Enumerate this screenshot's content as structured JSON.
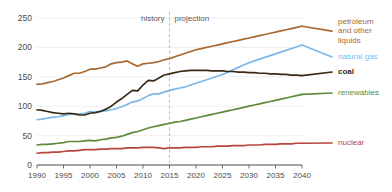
{
  "chart_data": {
    "type": "line",
    "title": "",
    "subtitle": "",
    "xlabel": "",
    "ylabel": "",
    "xlim": [
      1990,
      2040
    ],
    "ylim": [
      0,
      250
    ],
    "grid": true,
    "legend_position": "right-inline",
    "yticks": [
      0,
      50,
      100,
      150,
      200,
      250
    ],
    "ytick_labels": [
      "0",
      "50",
      "100",
      "150",
      "200",
      "250"
    ],
    "xticks": [
      1990,
      1995,
      2000,
      2005,
      2010,
      2015,
      2020,
      2025,
      2030,
      2035,
      2040
    ],
    "xtick_labels": [
      "1990",
      "1995",
      "2000",
      "2005",
      "2010",
      "2015",
      "2020",
      "2025",
      "2030",
      "2035",
      "2040"
    ],
    "annotations": [
      {
        "text": "history",
        "x": 2006,
        "y": 245
      },
      {
        "text": "projection",
        "x": 2023,
        "y": 245
      }
    ],
    "divider_x": 2015,
    "x": [
      1990,
      1991,
      1992,
      1993,
      1994,
      1995,
      1996,
      1997,
      1998,
      1999,
      2000,
      2001,
      2002,
      2003,
      2004,
      2005,
      2006,
      2007,
      2008,
      2009,
      2010,
      2011,
      2012,
      2013,
      2014,
      2015,
      2016,
      2017,
      2018,
      2019,
      2020,
      2021,
      2022,
      2023,
      2024,
      2025,
      2026,
      2027,
      2028,
      2029,
      2030,
      2031,
      2032,
      2033,
      2034,
      2035,
      2036,
      2037,
      2038,
      2039,
      2040
    ],
    "series": [
      {
        "name": "petroleum and other liquids",
        "color": "#a9682f",
        "label": "petroleum\nand other\nliquids",
        "label_lines": [
          "petroleum",
          "and other",
          "liquids"
        ],
        "values": [
          137,
          138,
          140,
          142,
          145,
          148,
          152,
          156,
          156,
          159,
          163,
          163,
          165,
          167,
          172,
          174,
          175,
          177,
          172,
          168,
          172,
          173,
          174,
          176,
          179,
          181,
          184,
          187,
          190,
          193,
          196,
          198,
          200,
          202,
          204,
          206,
          208,
          210,
          212,
          214,
          216,
          218,
          220,
          222,
          224,
          226,
          228,
          230,
          232,
          234,
          236
        ]
      },
      {
        "name": "natural gas",
        "color": "#7cb8e8",
        "label": "natural gas",
        "label_lines": [
          "natural gas"
        ],
        "values": [
          77,
          78,
          80,
          81,
          82,
          84,
          86,
          87,
          87,
          88,
          91,
          90,
          92,
          92,
          94,
          96,
          99,
          103,
          107,
          109,
          113,
          118,
          121,
          121,
          124,
          127,
          129,
          131,
          133,
          136,
          139,
          142,
          145,
          148,
          151,
          154,
          158,
          162,
          166,
          170,
          174,
          177,
          180,
          183,
          186,
          189,
          192,
          195,
          198,
          201,
          204
        ]
      },
      {
        "name": "coal",
        "color": "#3a2a14",
        "label": "coal",
        "label_lines": [
          "coal"
        ],
        "values": [
          94,
          93,
          91,
          89,
          88,
          87,
          88,
          87,
          85,
          85,
          88,
          89,
          91,
          95,
          100,
          107,
          113,
          120,
          127,
          126,
          136,
          144,
          143,
          148,
          153,
          155,
          157,
          159,
          160,
          161,
          161,
          161,
          161,
          160,
          160,
          160,
          159,
          159,
          158,
          158,
          157,
          157,
          156,
          156,
          155,
          155,
          154,
          154,
          153,
          153,
          152
        ]
      },
      {
        "name": "renewables",
        "color": "#5c8a3a",
        "label": "renewables",
        "label_lines": [
          "renewables"
        ],
        "values": [
          34,
          35,
          35,
          36,
          37,
          38,
          40,
          40,
          40,
          41,
          42,
          41,
          43,
          44,
          46,
          47,
          49,
          52,
          55,
          57,
          60,
          63,
          65,
          67,
          69,
          71,
          73,
          74,
          76,
          78,
          80,
          82,
          84,
          86,
          88,
          90,
          92,
          94,
          96,
          98,
          100,
          102,
          104,
          106,
          108,
          110,
          112,
          114,
          116,
          118,
          120
        ]
      },
      {
        "name": "nuclear",
        "color": "#b5473c",
        "label": "nuclear",
        "label_lines": [
          "nuclear"
        ],
        "values": [
          20,
          21,
          21,
          22,
          22,
          23,
          24,
          24,
          25,
          26,
          26,
          26,
          27,
          27,
          28,
          28,
          28,
          29,
          29,
          29,
          30,
          30,
          30,
          29,
          28,
          29,
          29,
          29,
          30,
          30,
          30,
          31,
          31,
          31,
          32,
          32,
          32,
          33,
          33,
          33,
          34,
          34,
          34,
          35,
          35,
          35,
          36,
          36,
          36,
          37,
          37
        ]
      }
    ]
  }
}
